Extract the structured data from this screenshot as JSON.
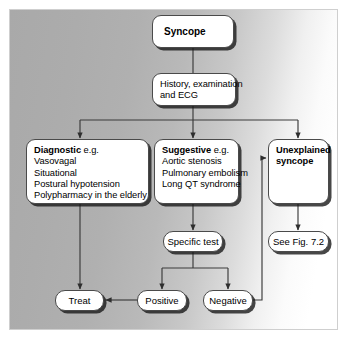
{
  "figure": {
    "background_start_color": "#a9a9a9",
    "background_end_color": "#ffffff",
    "node_fill_color": "#ffffff",
    "node_border_color": "#4a4a4a",
    "connector_color": "#3a3a3a"
  },
  "nodes": {
    "syncope": {
      "label": "Syncope"
    },
    "history": {
      "line1": "History, examination",
      "line2": "and ECG"
    },
    "diagnostic": {
      "lead": "Diagnostic",
      "lead_suffix": " e.g.",
      "items": [
        "Vasovagal",
        "Situational",
        "Postural hypotension",
        "Polypharmacy in the elderly"
      ]
    },
    "suggestive": {
      "lead": "Suggestive",
      "lead_suffix": " e.g.",
      "items": [
        "Aortic stenosis",
        "Pulmonary embolism",
        "Long QT syndrome"
      ]
    },
    "unexplained": {
      "line1": "Unexplained",
      "line2": "syncope"
    },
    "see_fig": {
      "label": "See Fig. 7.2"
    },
    "specific_test": {
      "label": "Specific test"
    },
    "treat": {
      "label": "Treat"
    },
    "positive": {
      "label": "Positive"
    },
    "negative": {
      "label": "Negative"
    }
  },
  "edges": [
    {
      "name": "syncope-to-history",
      "from": "syncope",
      "to": "history",
      "arrow": false
    },
    {
      "name": "history-to-diagnostic",
      "from": "history",
      "to": "diagnostic",
      "arrow": true
    },
    {
      "name": "history-to-suggestive",
      "from": "history",
      "to": "suggestive",
      "arrow": true
    },
    {
      "name": "history-to-unexplained",
      "from": "history",
      "to": "unexplained",
      "arrow": true
    },
    {
      "name": "diagnostic-to-treat",
      "from": "diagnostic",
      "to": "treat",
      "arrow": true
    },
    {
      "name": "suggestive-to-specific-test",
      "from": "suggestive",
      "to": "specific_test",
      "arrow": true
    },
    {
      "name": "unexplained-to-see-fig",
      "from": "unexplained",
      "to": "see_fig",
      "arrow": true
    },
    {
      "name": "specific-test-to-positive",
      "from": "specific_test",
      "to": "positive",
      "arrow": true
    },
    {
      "name": "specific-test-to-negative",
      "from": "specific_test",
      "to": "negative",
      "arrow": true
    },
    {
      "name": "positive-to-treat",
      "from": "positive",
      "to": "treat",
      "arrow": true
    },
    {
      "name": "negative-to-unexplained",
      "from": "negative",
      "to": "unexplained",
      "arrow": true
    }
  ]
}
